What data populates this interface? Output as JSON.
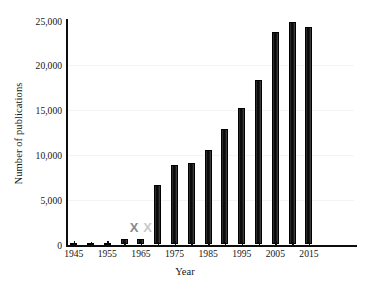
{
  "chart_data": {
    "type": "bar",
    "title": "",
    "subtitle": "",
    "xlabel": "Year",
    "ylabel": "Number of publications",
    "categories": [
      1945,
      1950,
      1955,
      1960,
      1965,
      1970,
      1975,
      1980,
      1985,
      1990,
      1995,
      2000,
      2005,
      2010,
      2015
    ],
    "values": [
      200,
      200,
      200,
      600,
      600,
      6600,
      8900,
      9100,
      10500,
      12900,
      15200,
      18400,
      23700,
      24800,
      24300
    ],
    "xlim": [
      1943,
      2029
    ],
    "ylim": [
      0,
      25000
    ],
    "ytick_labels": [
      "0",
      "5,000",
      "10,000",
      "15,000",
      "20,000",
      "25,000"
    ],
    "ytick_values": [
      0,
      5000,
      10000,
      15000,
      20000,
      25000
    ],
    "xtick_labels": [
      "1945",
      "1955",
      "1965",
      "1975",
      "1985",
      "1995",
      "2005",
      "2015"
    ],
    "xtick_values": [
      1945,
      1955,
      1965,
      1975,
      1985,
      1995,
      2005,
      2015
    ],
    "grid": false,
    "legend": null,
    "bar_color": "#141414",
    "annotations": [
      {
        "text": "X",
        "x": 1963,
        "y": 1200,
        "color": "#8a8a8a"
      },
      {
        "text": "X",
        "x": 1967,
        "y": 1200,
        "color": "#c9c9c9"
      }
    ]
  }
}
